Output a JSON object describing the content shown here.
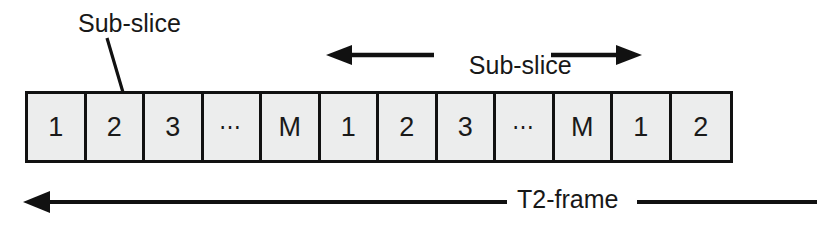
{
  "diagram": {
    "colors": {
      "stroke": "#111111",
      "cell_fill": "#eceded",
      "text": "#181818",
      "background": "#ffffff"
    },
    "annotations": {
      "subslice_callout": "Sub-slice",
      "interval_label_line1": "Sub-slice",
      "interval_label_line2": "interval",
      "frame_label": "T2-frame"
    },
    "slice_bar": {
      "cell_count": 12,
      "cells": [
        {
          "label": "1"
        },
        {
          "label": "2"
        },
        {
          "label": "3"
        },
        {
          "label": "⋯"
        },
        {
          "label": "M"
        },
        {
          "label": "1"
        },
        {
          "label": "2"
        },
        {
          "label": "3"
        },
        {
          "label": "⋯"
        },
        {
          "label": "M"
        },
        {
          "label": "1"
        },
        {
          "label": "2"
        }
      ]
    },
    "arrows": [
      {
        "name": "interval-left-arrow",
        "direction": "left"
      },
      {
        "name": "interval-right-arrow",
        "direction": "right"
      },
      {
        "name": "t2frame-left-arrow",
        "direction": "left"
      },
      {
        "name": "t2frame-right-rule",
        "direction": "none"
      }
    ]
  }
}
